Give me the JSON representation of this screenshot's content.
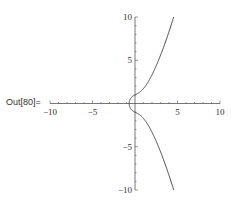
{
  "cell": {
    "out_label": "Out[80]="
  },
  "chart_data": {
    "type": "line",
    "title": "",
    "xlabel": "",
    "ylabel": "",
    "equation": "y^2 = x^3 + x + 1",
    "xlim": [
      -10,
      10
    ],
    "ylim": [
      -10,
      10
    ],
    "x_ticks": [
      -10,
      -5,
      5,
      10
    ],
    "y_ticks": [
      -10,
      -5,
      5,
      10
    ],
    "grid": false,
    "series": [
      {
        "name": "upper branch",
        "x": [
          -0.68,
          -0.5,
          0,
          0.5,
          1,
          1.5,
          2,
          2.5,
          3,
          3.5,
          4,
          4.5
        ],
        "y": [
          0,
          0.79,
          1,
          1.27,
          1.73,
          2.37,
          3.32,
          4.33,
          5.57,
          6.9,
          8.31,
          9.83
        ]
      },
      {
        "name": "lower branch",
        "x": [
          -0.68,
          -0.5,
          0,
          0.5,
          1,
          1.5,
          2,
          2.5,
          3,
          3.5,
          4,
          4.5
        ],
        "y": [
          0,
          -0.79,
          -1,
          -1.27,
          -1.73,
          -2.37,
          -3.32,
          -4.33,
          -5.57,
          -6.9,
          -8.31,
          -9.83
        ]
      }
    ],
    "style": {
      "line_color": "#444444",
      "axis_color": "#555555"
    }
  }
}
